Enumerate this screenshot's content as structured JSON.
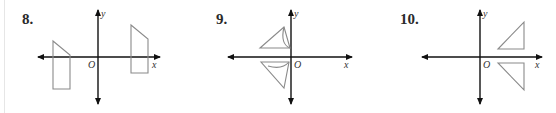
{
  "problems": [
    {
      "number": "8.",
      "origin_label": "O",
      "x_label": "x",
      "y_label": "y"
    },
    {
      "number": "9.",
      "origin_label": "O",
      "x_label": "x",
      "y_label": "y"
    },
    {
      "number": "10.",
      "origin_label": "O",
      "x_label": "x",
      "y_label": "y"
    }
  ],
  "colors": {
    "axis": "#111111",
    "shape": "#8a8a8a",
    "number": "#2a2a2a"
  }
}
